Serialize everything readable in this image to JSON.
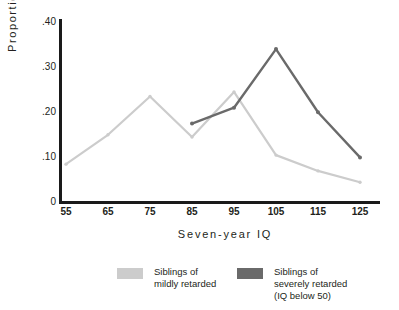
{
  "chart_data": {
    "type": "line",
    "title": "",
    "xlabel": "Seven-year IQ",
    "ylabel": "Proportion",
    "x": [
      55,
      65,
      75,
      85,
      95,
      105,
      115,
      125
    ],
    "xticklabels": [
      "55",
      "65",
      "75",
      "85",
      "95",
      "105",
      "115",
      "125"
    ],
    "yticklabels": [
      ".40",
      ".30",
      ".20",
      ".10",
      "0"
    ],
    "ytickvalues": [
      0.4,
      0.3,
      0.2,
      0.1,
      0
    ],
    "xlim": [
      50,
      130
    ],
    "ylim": [
      0,
      0.4
    ],
    "grid": false,
    "legend_position": "bottom",
    "series": [
      {
        "name": "Siblings of mildly retarded",
        "legend_lines": [
          "Siblings of",
          "mildly retarded"
        ],
        "color": "#cccccc",
        "x": [
          55,
          65,
          75,
          85,
          95,
          105,
          115,
          125
        ],
        "values": [
          0.085,
          0.15,
          0.235,
          0.145,
          0.245,
          0.105,
          0.07,
          0.045
        ]
      },
      {
        "name": "Siblings of severely retarded (IQ below 50)",
        "legend_lines": [
          "Siblings of",
          "severely retarded",
          "(IQ below 50)"
        ],
        "color": "#6a6a6a",
        "x": [
          85,
          95,
          105,
          115,
          125
        ],
        "values": [
          0.175,
          0.21,
          0.34,
          0.2,
          0.1
        ]
      }
    ]
  },
  "axis": {
    "ylabel": "Proportion",
    "xlabel": "Seven-year IQ"
  }
}
